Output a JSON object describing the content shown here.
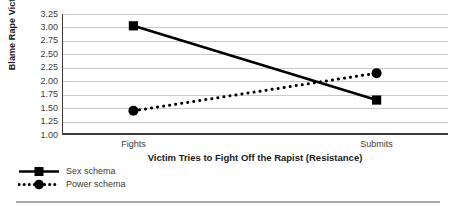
{
  "chart_data": {
    "type": "line",
    "title": "",
    "xlabel": "Victim Tries to Fight Off the Rapist (Resistance)",
    "ylabel": "Blame Rape Victim",
    "categories": [
      "Fights",
      "Submits"
    ],
    "ylim": [
      1.0,
      3.25
    ],
    "yticks": [
      "3.25",
      "3.00",
      "2.75",
      "2.50",
      "2.25",
      "2.00",
      "1.75",
      "1.50",
      "1.25",
      "1.00"
    ],
    "ytick_values": [
      3.25,
      3.0,
      2.75,
      2.5,
      2.25,
      2.0,
      1.75,
      1.5,
      1.25,
      1.0
    ],
    "grid": true,
    "legend_position": "bottom-left",
    "series": [
      {
        "name": "Sex schema",
        "values": [
          3.03,
          1.65
        ],
        "marker": "square",
        "linestyle": "solid",
        "color": "#000000"
      },
      {
        "name": "Power schema",
        "values": [
          1.45,
          2.15
        ],
        "marker": "circle",
        "linestyle": "dotted",
        "color": "#000000"
      }
    ]
  },
  "colors": {
    "series": "#000000",
    "gridline": "#c9c9c9",
    "axis": "#3a3a3a",
    "tick_text": "#3b3b3b",
    "title_text": "#1a1a1a",
    "rule": "#a9a9a9"
  },
  "legend": {
    "items": [
      {
        "label": "Sex schema",
        "marker": "square-solid-line-key"
      },
      {
        "label": "Power schema",
        "marker": "circle-dotted-line-key"
      }
    ]
  }
}
